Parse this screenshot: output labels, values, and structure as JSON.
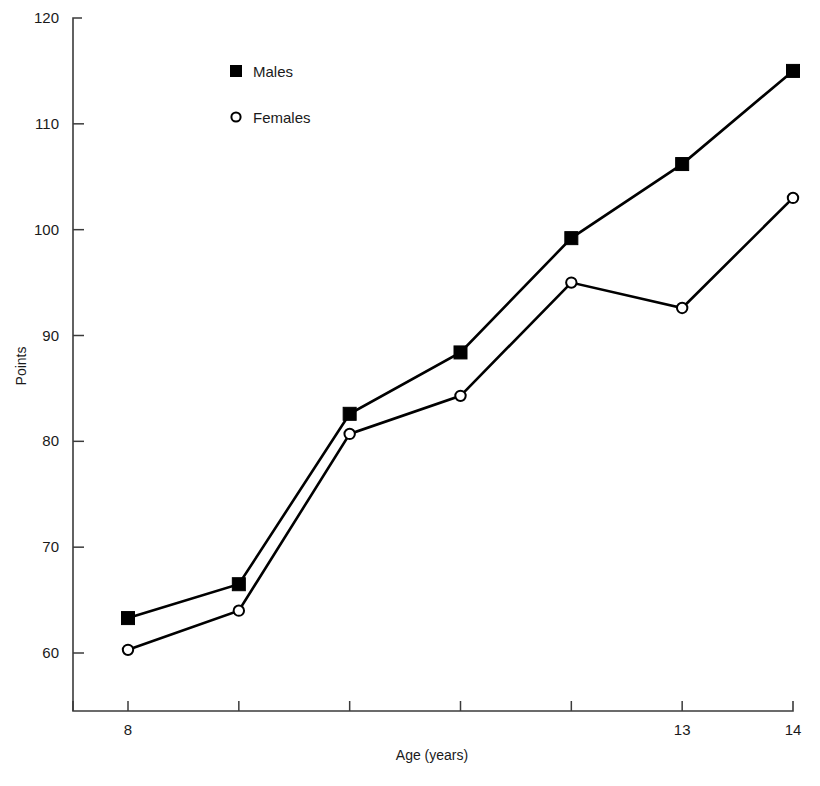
{
  "chart_data": {
    "type": "line",
    "title": "",
    "xlabel": "Age (years)",
    "ylabel": "Points",
    "x": [
      8,
      9,
      10,
      11,
      12,
      13,
      14
    ],
    "xtick_labels": [
      "8",
      "",
      "",
      "",
      "",
      "13",
      "14"
    ],
    "xlim": [
      7.6,
      14.3
    ],
    "ylim": [
      56,
      120
    ],
    "ytick_values": [
      60,
      70,
      80,
      90,
      100,
      110,
      120
    ],
    "ytick_labels": [
      "60",
      "70",
      "80",
      "90",
      "100",
      "110",
      "120"
    ],
    "grid": false,
    "legend_position": "top-left-inside",
    "series": [
      {
        "name": "Males",
        "marker": "filled-square",
        "color": "#000000",
        "values": [
          63.3,
          66.5,
          82.6,
          88.4,
          99.2,
          106.2,
          115.0
        ]
      },
      {
        "name": "Females",
        "marker": "open-circle",
        "color": "#000000",
        "values": [
          60.3,
          64.0,
          80.7,
          84.3,
          95.0,
          92.6,
          103.0
        ]
      }
    ]
  },
  "legend": {
    "entries": [
      {
        "label": "Males",
        "marker": "filled-square"
      },
      {
        "label": "Females",
        "marker": "open-circle"
      }
    ]
  },
  "axes": {
    "y_title": "Points",
    "x_title": "Age (years)"
  }
}
